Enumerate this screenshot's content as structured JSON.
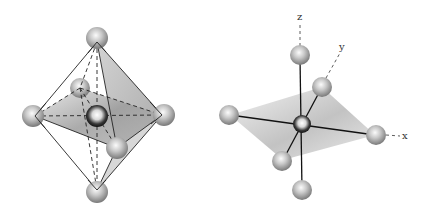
{
  "diagram": {
    "title": "",
    "figures": [
      {
        "id": "octahedron-wireframe",
        "description": "Octahedron with six ligand spheres at vertices and central atom; dashed hidden edges, shaded equatorial plane"
      },
      {
        "id": "octahedral-coordination-axes",
        "description": "Central atom bonded to six ligands along x, y, z axes with shaded equatorial plane",
        "axis_labels": {
          "z": "z",
          "y": "y",
          "x": "x"
        }
      }
    ],
    "colors": {
      "sphere_light": "#f4f4f4",
      "sphere_dark": "#7a7a7a",
      "plane_shade": "#9a9a9a",
      "line": "#222222"
    }
  }
}
